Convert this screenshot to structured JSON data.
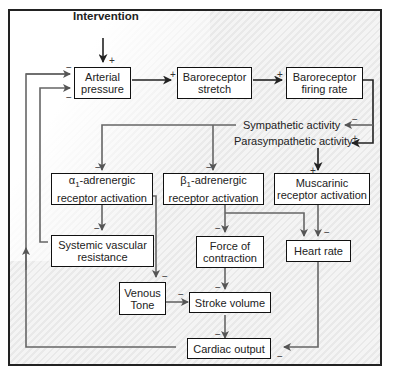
{
  "diagram": {
    "input": {
      "label": "Intervention",
      "sign": "+"
    },
    "nodes": {
      "arterial_pressure": "Arterial pressure",
      "baroreceptor_stretch": "Baroreceptor stretch",
      "baroreceptor_firing_rate": "Baroreceptor firing rate",
      "sympathetic_activity": "Sympathetic activity",
      "parasympathetic_activity": "Parasympathetic activity",
      "alpha1_activation": "α1-adrenergic receptor activation",
      "beta1_activation": "β1-adrenergic receptor activation",
      "muscarinic_activation": "Muscarinic receptor activation",
      "systemic_vascular_resistance": "Systemic vascular resistance",
      "force_of_contraction": "Force of contraction",
      "heart_rate": "Heart rate",
      "venous_tone": "Venous Tone",
      "stroke_volume": "Stroke volume",
      "cardiac_output": "Cardiac output"
    },
    "node_lines": {
      "arterial_pressure": [
        "Arterial",
        "pressure"
      ],
      "baroreceptor_stretch": [
        "Baroreceptor",
        "stretch"
      ],
      "baroreceptor_firing_rate": [
        "Baroreceptor",
        "firing rate"
      ],
      "alpha1_activation": [
        "α",
        "1",
        "-adrenergic",
        "receptor activation"
      ],
      "beta1_activation": [
        "β",
        "1",
        "-adrenergic",
        "receptor activation"
      ],
      "muscarinic_activation": [
        "Muscarinic",
        "receptor activation"
      ],
      "systemic_vascular_resistance": [
        "Systemic vascular",
        "resistance"
      ],
      "force_of_contraction": [
        "Force of",
        "contraction"
      ],
      "venous_tone": [
        "Venous",
        "Tone"
      ]
    },
    "edges": [
      {
        "from": "Intervention",
        "to": "Arterial pressure",
        "sign": "+"
      },
      {
        "from": "Arterial pressure",
        "to": "Baroreceptor stretch",
        "sign": "+"
      },
      {
        "from": "Baroreceptor stretch",
        "to": "Baroreceptor firing rate",
        "sign": "+"
      },
      {
        "from": "Baroreceptor firing rate",
        "to": "Sympathetic activity",
        "sign": "−"
      },
      {
        "from": "Baroreceptor firing rate",
        "to": "Parasympathetic activity",
        "sign": "+"
      },
      {
        "from": "Sympathetic activity",
        "to": "α1-adrenergic receptor activation",
        "sign": "−"
      },
      {
        "from": "Sympathetic activity",
        "to": "β1-adrenergic receptor activation",
        "sign": "−"
      },
      {
        "from": "Parasympathetic activity",
        "to": "Muscarinic receptor activation",
        "sign": "+"
      },
      {
        "from": "α1-adrenergic receptor activation",
        "to": "Systemic vascular resistance",
        "sign": "−"
      },
      {
        "from": "α1-adrenergic receptor activation",
        "to": "Venous Tone",
        "sign": "−"
      },
      {
        "from": "β1-adrenergic receptor activation",
        "to": "Force of contraction",
        "sign": "−"
      },
      {
        "from": "β1-adrenergic receptor activation",
        "to": "Heart rate",
        "sign": ""
      },
      {
        "from": "Muscarinic receptor activation",
        "to": "Heart rate",
        "sign": "−"
      },
      {
        "from": "Force of contraction",
        "to": "Stroke volume",
        "sign": "−"
      },
      {
        "from": "Venous Tone",
        "to": "Stroke volume",
        "sign": "−"
      },
      {
        "from": "Stroke volume",
        "to": "Cardiac output",
        "sign": "−"
      },
      {
        "from": "Heart rate",
        "to": "Cardiac output",
        "sign": "−"
      },
      {
        "from": "Systemic vascular resistance",
        "to": "Arterial pressure",
        "sign": "−"
      },
      {
        "from": "Cardiac output",
        "to": "Arterial pressure",
        "sign": "−"
      }
    ],
    "signs": {
      "plus": "+",
      "minus": "−"
    }
  }
}
